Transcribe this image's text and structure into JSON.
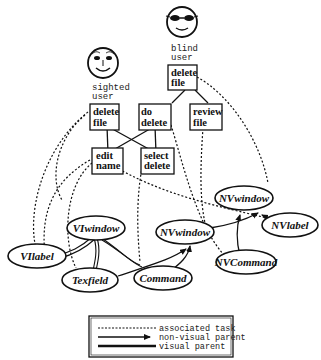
{
  "users": {
    "sighted": {
      "line1": "sighted",
      "line2": "user"
    },
    "blind": {
      "line1": "blind",
      "line2": "user"
    }
  },
  "tasks": {
    "delete_file_sighted": {
      "line1": "delete",
      "line2": "file"
    },
    "do_delete": {
      "line1": "do",
      "line2": "delete"
    },
    "delete_file_blind": {
      "line1": "delete",
      "line2": "file"
    },
    "review_file": {
      "line1": "review",
      "line2": "file"
    },
    "edit_name": {
      "line1": "edit",
      "line2": "name"
    },
    "select_delete": {
      "line1": "select",
      "line2": "delete"
    }
  },
  "widgets": {
    "viwindow": "VIwindow",
    "vilabel": "VIlabel",
    "texfield": "Texfield",
    "command": "Command",
    "nvwindow_child": "NVwindow",
    "nvwindow_top": "NVwindow",
    "nvlabel": "NVlabel",
    "nvcommand": "NVCommand"
  },
  "legend": {
    "associated_task": "associated task",
    "non_visual_parent": "non-visual parent",
    "visual_parent": "visual parent"
  },
  "colors": {
    "line": "#111111",
    "background": "#ffffff"
  }
}
